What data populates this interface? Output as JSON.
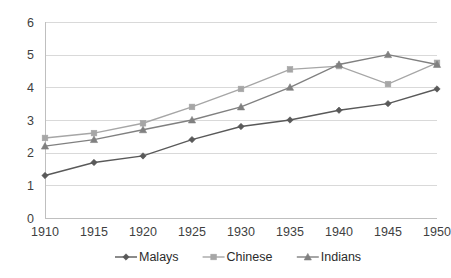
{
  "chart_data": {
    "type": "line",
    "title": "",
    "xlabel": "",
    "ylabel": "",
    "categories": [
      "1910",
      "1915",
      "1920",
      "1925",
      "1930",
      "1935",
      "1940",
      "1945",
      "1950"
    ],
    "x": [
      1910,
      1915,
      1920,
      1925,
      1930,
      1935,
      1940,
      1945,
      1950
    ],
    "ylim": [
      0,
      6
    ],
    "yticks": [
      "0",
      "1",
      "2",
      "3",
      "4",
      "5",
      "6"
    ],
    "ytick_values": [
      0,
      1,
      2,
      3,
      4,
      5,
      6
    ],
    "grid": true,
    "legend_position": "bottom",
    "series": [
      {
        "name": "Malays",
        "marker": "diamond",
        "color": "#595959",
        "values": [
          1.3,
          1.7,
          1.9,
          2.4,
          2.8,
          3.0,
          3.3,
          3.5,
          3.95
        ]
      },
      {
        "name": "Chinese",
        "marker": "square",
        "color": "#a6a6a6",
        "values": [
          2.45,
          2.6,
          2.9,
          3.4,
          3.95,
          4.55,
          4.65,
          4.1,
          4.75
        ]
      },
      {
        "name": "Indians",
        "marker": "triangle",
        "color": "#808080",
        "values": [
          2.2,
          2.4,
          2.7,
          3.0,
          3.4,
          4.0,
          4.7,
          5.0,
          4.7
        ]
      }
    ]
  },
  "colors": {
    "gridline": "#d9d9d9",
    "axis": "#bfbfbf",
    "text": "#3f3f3f",
    "background": "#ffffff"
  }
}
